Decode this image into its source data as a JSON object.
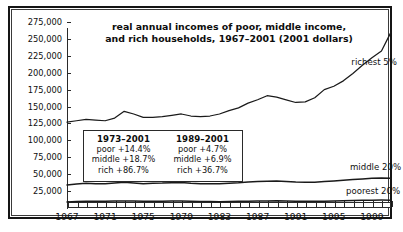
{
  "chart_data": {
    "type": "line",
    "title": "real annual incomes of poor, middle income, and rich households, 1967–2001 (2001 dollars)",
    "title_line1": "real annual incomes of poor, middle income,",
    "title_line2": "and rich households, 1967–2001 (2001 dollars)",
    "xlabel": "",
    "ylabel": "",
    "xlim": [
      1967,
      2001
    ],
    "ylim": [
      0,
      275000
    ],
    "grid": false,
    "legend_position": "inline-right",
    "ytick_labels": [
      "275,000",
      "250,000",
      "225,000",
      "200,000",
      "175,000",
      "150,000",
      "125,000",
      "100,000",
      "75,000",
      "50,000",
      "25,000"
    ],
    "ytick_values": [
      275000,
      250000,
      225000,
      200000,
      175000,
      150000,
      125000,
      100000,
      75000,
      50000,
      25000
    ],
    "xtick_labels": [
      "1967",
      "1971",
      "1975",
      "1979",
      "1983",
      "1987",
      "1991",
      "1995",
      "1999"
    ],
    "xtick_values": [
      1967,
      1971,
      1975,
      1979,
      1983,
      1987,
      1991,
      1995,
      1999
    ],
    "x": [
      1967,
      1968,
      1969,
      1970,
      1971,
      1972,
      1973,
      1974,
      1975,
      1976,
      1977,
      1978,
      1979,
      1980,
      1981,
      1982,
      1983,
      1984,
      1985,
      1986,
      1987,
      1988,
      1989,
      1990,
      1991,
      1992,
      1993,
      1994,
      1995,
      1996,
      1997,
      1998,
      1999,
      2000,
      2001
    ],
    "series": [
      {
        "name": "richest 5%",
        "label": "richest 5%",
        "values": [
          127000,
          129000,
          131000,
          130000,
          129000,
          133000,
          143000,
          139000,
          134000,
          134000,
          135000,
          137000,
          139000,
          136000,
          135000,
          136000,
          139000,
          144000,
          148000,
          155000,
          160000,
          166000,
          164000,
          160000,
          156000,
          157000,
          163000,
          175000,
          180000,
          188000,
          199000,
          211000,
          222000,
          232000,
          260000
        ]
      },
      {
        "name": "middle 20%",
        "label": "middle 20%",
        "values": [
          34000,
          35500,
          36500,
          36000,
          35800,
          37000,
          38000,
          37000,
          36000,
          36500,
          36800,
          37500,
          37800,
          36500,
          36000,
          35800,
          35800,
          36500,
          37200,
          38500,
          39000,
          39500,
          40000,
          39200,
          38300,
          38000,
          38200,
          39000,
          40000,
          41000,
          42000,
          43000,
          44000,
          44500,
          44000
        ]
      },
      {
        "name": "poorest 20%",
        "label": "poorest 20%",
        "values": [
          9000,
          9500,
          10000,
          10000,
          10000,
          10200,
          10500,
          10300,
          10000,
          10100,
          10100,
          10300,
          10300,
          10000,
          9700,
          9500,
          9400,
          9600,
          9800,
          10100,
          10300,
          10400,
          10600,
          10300,
          10000,
          9900,
          9800,
          10000,
          10300,
          10600,
          11000,
          11300,
          11600,
          11700,
          11500
        ]
      }
    ],
    "annotations": [
      {
        "name": "period-1973-2001",
        "heading": "1973–2001",
        "rows": [
          "poor +14.4%",
          "middle +18.7%",
          "rich +86.7%"
        ]
      },
      {
        "name": "period-1989-2001",
        "heading": "1989–2001",
        "rows": [
          "poor +4.7%",
          "middle +6.9%",
          "rich +36.7%"
        ]
      }
    ]
  },
  "colors": {
    "line": "#1a1a1a",
    "frame": "#151515",
    "background": "#ffffff",
    "text": "#111111"
  }
}
